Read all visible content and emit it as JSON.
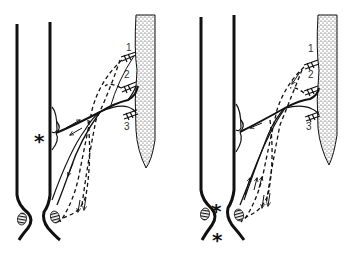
{
  "figure": {
    "panels": [
      {
        "id": "left",
        "labels": [
          "1",
          "2",
          "3"
        ],
        "asterisks": [
          "*"
        ]
      },
      {
        "id": "right",
        "labels": [
          "1",
          "2",
          "3"
        ],
        "asterisks": [
          "*",
          "*"
        ]
      }
    ],
    "colors": {
      "ink": "#111111",
      "background": "#ffffff",
      "stipple": "#333333"
    }
  }
}
